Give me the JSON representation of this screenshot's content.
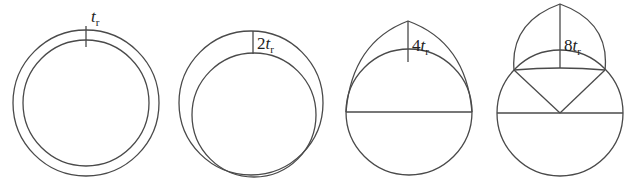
{
  "figure": {
    "panels": [
      {
        "id": "stage-1",
        "label_coef": "",
        "label_var": "t",
        "label_sub": "r"
      },
      {
        "id": "stage-2",
        "label_coef": "2",
        "label_var": "t",
        "label_sub": "r"
      },
      {
        "id": "stage-3",
        "label_coef": "4",
        "label_var": "t",
        "label_sub": "r"
      },
      {
        "id": "stage-4",
        "label_coef": "8",
        "label_var": "t",
        "label_sub": "r"
      }
    ]
  },
  "colors": {
    "stroke": "#4a4a4a",
    "text": "#222222",
    "background": "#ffffff"
  }
}
